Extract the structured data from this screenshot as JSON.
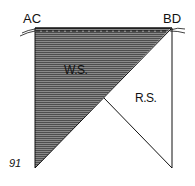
{
  "diagram": {
    "corner_labels": {
      "top_left": "AC",
      "top_right": "BD"
    },
    "region_labels": {
      "wrong_side": "W.S.",
      "right_side": "R.S."
    },
    "figure_number": "91",
    "colors": {
      "shading": "#6a6a6a",
      "stroke": "#111111",
      "background": "#ffffff"
    }
  }
}
